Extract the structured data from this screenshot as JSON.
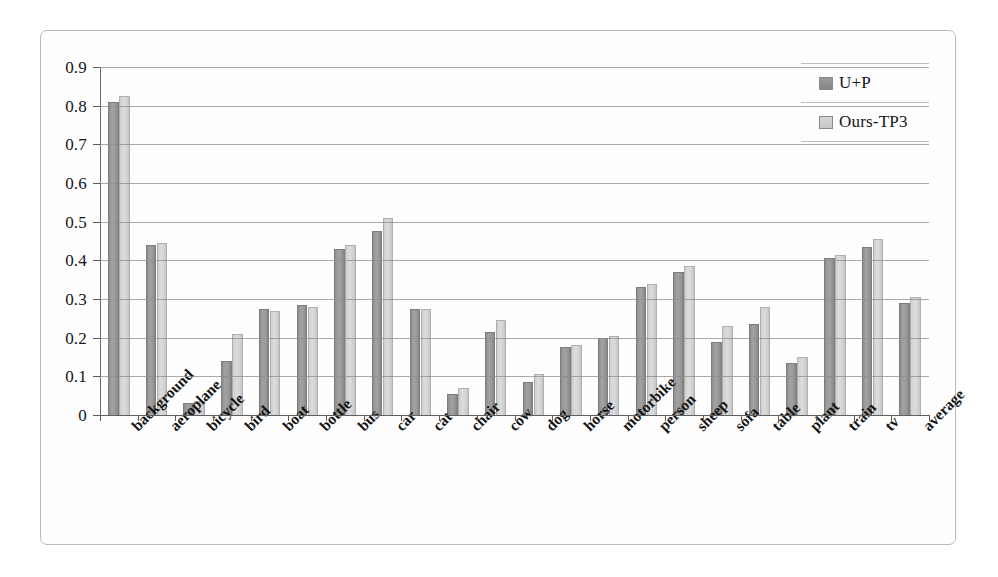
{
  "chart_data": {
    "type": "bar",
    "title": "",
    "xlabel": "",
    "ylabel": "",
    "ylim": [
      0,
      0.9
    ],
    "yticks": [
      "0",
      "0.1",
      "0.2",
      "0.3",
      "0.4",
      "0.5",
      "0.6",
      "0.7",
      "0.8",
      "0.9"
    ],
    "grid": true,
    "legend_position": "top-right",
    "categories": [
      "background",
      "aeroplane",
      "bicycle",
      "bird",
      "boat",
      "bottle",
      "bus",
      "car",
      "cat",
      "chair",
      "cow",
      "dog",
      "horse",
      "motorbike",
      "person",
      "sheep",
      "sofa",
      "table",
      "plant",
      "train",
      "tv",
      "average"
    ],
    "series": [
      {
        "name": "U+P",
        "color": "#9a9a9a",
        "values": [
          0.81,
          0.44,
          0.03,
          0.14,
          0.275,
          0.285,
          0.43,
          0.475,
          0.275,
          0.055,
          0.215,
          0.085,
          0.175,
          0.2,
          0.33,
          0.37,
          0.19,
          0.235,
          0.135,
          0.405,
          0.435,
          0.29
        ]
      },
      {
        "name": "Ours-TP3",
        "color": "#d4d4d4",
        "values": [
          0.825,
          0.445,
          0.035,
          0.21,
          0.27,
          0.28,
          0.44,
          0.51,
          0.275,
          0.07,
          0.245,
          0.105,
          0.18,
          0.205,
          0.34,
          0.385,
          0.23,
          0.28,
          0.15,
          0.415,
          0.455,
          0.305
        ]
      }
    ]
  },
  "legend": {
    "entries": [
      {
        "label": "U+P",
        "swatch": "series-0-swatch"
      },
      {
        "label": "Ours-TP3",
        "swatch": "series-1-swatch"
      }
    ]
  }
}
